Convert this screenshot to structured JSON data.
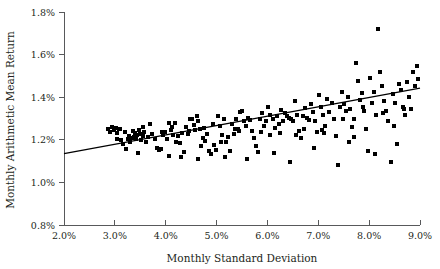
{
  "chart_data": {
    "type": "scatter",
    "title": "",
    "xlabel": "Monthly Standard Deviation",
    "ylabel": "Monthly Arithmetic Mean Return",
    "xlim": [
      2.0,
      9.0
    ],
    "ylim": [
      0.8,
      1.8
    ],
    "grid": false,
    "legend": null,
    "x_tick_labels": [
      "2.0%",
      "3.0%",
      "4.0%",
      "5.0%",
      "6.0%",
      "7.0%",
      "8.0%",
      "9.0%"
    ],
    "x_tick_values": [
      2.0,
      3.0,
      4.0,
      5.0,
      6.0,
      7.0,
      8.0,
      9.0
    ],
    "y_tick_labels": [
      "0.8%",
      "1.0%",
      "1.2%",
      "1.4%",
      "1.6%",
      "1.8%"
    ],
    "y_tick_values": [
      0.8,
      1.0,
      1.2,
      1.4,
      1.6,
      1.8
    ],
    "marker": "square",
    "marker_color": "#000000",
    "marker_size_px": 4,
    "series": [
      {
        "name": "portfolios",
        "points": [
          [
            2.86,
            1.252
          ],
          [
            2.9,
            1.236
          ],
          [
            2.94,
            1.258
          ],
          [
            2.98,
            1.247
          ],
          [
            3.02,
            1.254
          ],
          [
            3.05,
            1.232
          ],
          [
            3.1,
            1.249
          ],
          [
            3.13,
            1.197
          ],
          [
            3.16,
            1.181
          ],
          [
            3.2,
            1.237
          ],
          [
            3.22,
            1.156
          ],
          [
            3.26,
            1.202
          ],
          [
            3.28,
            1.22
          ],
          [
            3.3,
            1.192
          ],
          [
            3.33,
            1.207
          ],
          [
            3.35,
            1.24
          ],
          [
            3.37,
            1.214
          ],
          [
            3.4,
            1.232
          ],
          [
            3.42,
            1.206
          ],
          [
            3.45,
            1.139
          ],
          [
            3.47,
            1.246
          ],
          [
            3.5,
            1.228
          ],
          [
            3.52,
            1.2
          ],
          [
            3.55,
            1.217
          ],
          [
            3.58,
            1.236
          ],
          [
            3.62,
            1.192
          ],
          [
            3.66,
            1.212
          ],
          [
            3.7,
            1.273
          ],
          [
            3.74,
            1.228
          ],
          [
            3.78,
            1.204
          ],
          [
            3.82,
            1.161
          ],
          [
            3.86,
            1.15
          ],
          [
            3.9,
            1.156
          ],
          [
            3.94,
            1.221
          ],
          [
            3.98,
            1.236
          ],
          [
            4.02,
            1.206
          ],
          [
            4.06,
            1.278
          ],
          [
            4.1,
            1.246
          ],
          [
            4.14,
            1.223
          ],
          [
            4.18,
            1.278
          ],
          [
            4.2,
            1.192
          ],
          [
            4.24,
            1.217
          ],
          [
            4.28,
            1.184
          ],
          [
            4.32,
            1.23
          ],
          [
            4.36,
            1.142
          ],
          [
            4.4,
            1.261
          ],
          [
            4.44,
            1.228
          ],
          [
            4.48,
            1.298
          ],
          [
            4.52,
            1.3
          ],
          [
            4.55,
            1.27
          ],
          [
            4.58,
            1.246
          ],
          [
            4.62,
            1.312
          ],
          [
            4.64,
            1.288
          ],
          [
            4.68,
            1.252
          ],
          [
            4.7,
            1.173
          ],
          [
            4.74,
            1.21
          ],
          [
            4.78,
            1.195
          ],
          [
            4.82,
            1.228
          ],
          [
            4.86,
            1.146
          ],
          [
            4.9,
            1.132
          ],
          [
            4.94,
            1.176
          ],
          [
            4.98,
            1.152
          ],
          [
            5.02,
            1.31
          ],
          [
            5.06,
            1.265
          ],
          [
            5.1,
            1.223
          ],
          [
            5.14,
            1.298
          ],
          [
            5.18,
            1.192
          ],
          [
            5.22,
            1.212
          ],
          [
            5.26,
            1.146
          ],
          [
            5.3,
            1.274
          ],
          [
            5.34,
            1.228
          ],
          [
            5.38,
            1.296
          ],
          [
            5.42,
            1.252
          ],
          [
            5.46,
            1.332
          ],
          [
            5.5,
            1.336
          ],
          [
            5.54,
            1.288
          ],
          [
            5.58,
            1.266
          ],
          [
            5.62,
            1.304
          ],
          [
            5.66,
            1.294
          ],
          [
            5.7,
            1.24
          ],
          [
            5.74,
            1.21
          ],
          [
            5.78,
            1.172
          ],
          [
            5.82,
            1.142
          ],
          [
            5.86,
            1.298
          ],
          [
            5.9,
            1.324
          ],
          [
            5.94,
            1.266
          ],
          [
            5.98,
            1.29
          ],
          [
            6.02,
            1.352
          ],
          [
            6.06,
            1.318
          ],
          [
            6.1,
            1.296
          ],
          [
            6.14,
            1.256
          ],
          [
            6.18,
            1.31
          ],
          [
            6.22,
            1.276
          ],
          [
            6.26,
            1.342
          ],
          [
            6.3,
            1.288
          ],
          [
            6.34,
            1.324
          ],
          [
            6.38,
            1.312
          ],
          [
            6.42,
            1.302
          ],
          [
            6.46,
            1.296
          ],
          [
            6.5,
            1.29
          ],
          [
            6.54,
            1.38
          ],
          [
            6.58,
            1.316
          ],
          [
            6.62,
            1.24
          ],
          [
            6.66,
            1.208
          ],
          [
            6.7,
            1.31
          ],
          [
            6.74,
            1.348
          ],
          [
            6.78,
            1.302
          ],
          [
            6.82,
            1.294
          ],
          [
            6.86,
            1.366
          ],
          [
            6.9,
            1.33
          ],
          [
            6.94,
            1.286
          ],
          [
            6.98,
            1.238
          ],
          [
            7.02,
            1.41
          ],
          [
            7.06,
            1.356
          ],
          [
            7.1,
            1.318
          ],
          [
            7.14,
            1.264
          ],
          [
            7.18,
            1.392
          ],
          [
            7.22,
            1.33
          ],
          [
            7.26,
            1.372
          ],
          [
            7.3,
            1.3
          ],
          [
            7.34,
            1.22
          ],
          [
            7.38,
            1.08
          ],
          [
            7.42,
            1.356
          ],
          [
            7.46,
            1.426
          ],
          [
            7.5,
            1.37
          ],
          [
            7.54,
            1.334
          ],
          [
            7.58,
            1.402
          ],
          [
            7.62,
            1.344
          ],
          [
            7.66,
            1.262
          ],
          [
            7.7,
            1.3
          ],
          [
            7.74,
            1.56
          ],
          [
            7.78,
            1.478
          ],
          [
            7.82,
            1.386
          ],
          [
            7.86,
            1.418
          ],
          [
            7.9,
            1.334
          ],
          [
            7.94,
            1.252
          ],
          [
            7.98,
            1.146
          ],
          [
            8.02,
            1.49
          ],
          [
            8.06,
            1.372
          ],
          [
            8.1,
            1.424
          ],
          [
            8.14,
            1.318
          ],
          [
            8.18,
            1.718
          ],
          [
            8.22,
            1.52
          ],
          [
            8.26,
            1.454
          ],
          [
            8.3,
            1.382
          ],
          [
            8.34,
            1.336
          ],
          [
            8.38,
            1.29
          ],
          [
            8.42,
            1.094
          ],
          [
            8.46,
            1.414
          ],
          [
            8.5,
            1.372
          ],
          [
            8.54,
            1.18
          ],
          [
            8.58,
            1.462
          ],
          [
            8.62,
            1.434
          ],
          [
            8.66,
            1.356
          ],
          [
            8.7,
            1.318
          ],
          [
            8.74,
            1.47
          ],
          [
            8.78,
            1.402
          ],
          [
            8.82,
            1.346
          ],
          [
            8.86,
            1.516
          ],
          [
            8.9,
            1.452
          ],
          [
            8.94,
            1.548
          ],
          [
            8.97,
            1.486
          ],
          [
            3.08,
            1.25
          ],
          [
            3.44,
            1.222
          ],
          [
            3.92,
            1.238
          ],
          [
            4.46,
            1.24
          ],
          [
            4.76,
            1.254
          ],
          [
            5.08,
            1.188
          ],
          [
            5.44,
            1.24
          ],
          [
            5.88,
            1.236
          ],
          [
            6.24,
            1.23
          ],
          [
            6.72,
            1.252
          ],
          [
            7.08,
            1.248
          ],
          [
            7.48,
            1.298
          ],
          [
            7.88,
            1.352
          ],
          [
            8.28,
            1.328
          ],
          [
            8.68,
            1.344
          ],
          [
            4.06,
            1.126
          ],
          [
            4.3,
            1.118
          ],
          [
            4.64,
            1.108
          ],
          [
            5.16,
            1.12
          ],
          [
            5.6,
            1.108
          ],
          [
            6.12,
            1.138
          ],
          [
            6.44,
            1.098
          ],
          [
            6.92,
            1.162
          ],
          [
            7.6,
            1.188
          ],
          [
            8.12,
            1.132
          ],
          [
            3.04,
            1.206
          ],
          [
            3.56,
            1.26
          ],
          [
            4.12,
            1.262
          ],
          [
            4.92,
            1.274
          ],
          [
            5.36,
            1.252
          ],
          [
            6.06,
            1.224
          ],
          [
            6.56,
            1.222
          ],
          [
            7.12,
            1.234
          ],
          [
            7.7,
            1.214
          ],
          [
            8.48,
            1.264
          ]
        ]
      }
    ],
    "trend_line": {
      "name": "regression-line",
      "x_start": 2.0,
      "y_start": 1.135,
      "x_end": 9.0,
      "y_end": 1.443,
      "color": "#000000"
    }
  }
}
